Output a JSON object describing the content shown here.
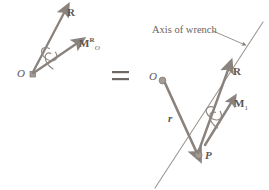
{
  "figure": {
    "caption_equals": "=",
    "left_system": {
      "origin_label": "O",
      "resultant_force_label": "R",
      "resultant_moment_label": "M",
      "resultant_moment_superscript": "R",
      "resultant_moment_subscript": "O",
      "origin_marker": "square-dot"
    },
    "right_system": {
      "origin_label": "O",
      "point_label": "P",
      "position_vector_label": "r",
      "resultant_force_label": "R",
      "moment_label": "M",
      "moment_subscript": "1",
      "axis_annotation": "Axis of wrench",
      "origin_marker": "round-dot",
      "point_marker": "round-dot"
    }
  },
  "colors": {
    "vector": "#8a827c",
    "vector_dark": "#6d6660",
    "text": "#5d5651",
    "note_text": "#6a6460",
    "axis_line": "#9a938d",
    "background": "#ffffff",
    "equals": "#6f6a66"
  }
}
